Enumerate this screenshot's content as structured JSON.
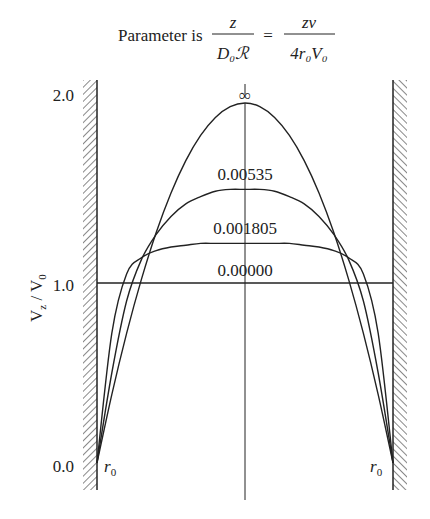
{
  "chart_data": {
    "type": "line",
    "title_parts": {
      "prefix": "Parameter is",
      "frac1_num": "z",
      "frac1_den": "D₀ℛ",
      "eq": "=",
      "frac2_num": "zv",
      "frac2_den": "4r₀V₀"
    },
    "xlabel": "",
    "ylabel": "Vz / V0",
    "ylabel_display": "V_z / V_0",
    "y_ticks": [
      "0.0",
      "1.0",
      "2.0"
    ],
    "ylim": [
      0,
      2.0
    ],
    "x_wall_labels": [
      "r₀",
      "r₀"
    ],
    "x": [
      -1.0,
      -0.9,
      -0.8,
      -0.7,
      -0.6,
      -0.5,
      -0.4,
      -0.3,
      -0.2,
      -0.1,
      0.0,
      0.1,
      0.2,
      0.3,
      0.4,
      0.5,
      0.6,
      0.7,
      0.8,
      0.9,
      1.0
    ],
    "series": [
      {
        "name": "∞",
        "values": [
          0.0,
          0.38,
          0.72,
          1.02,
          1.28,
          1.5,
          1.68,
          1.82,
          1.92,
          1.98,
          2.0,
          1.98,
          1.92,
          1.82,
          1.68,
          1.5,
          1.28,
          1.02,
          0.72,
          0.38,
          0.0
        ]
      },
      {
        "name": "0.00535",
        "values": [
          0.0,
          0.5,
          0.9,
          1.13,
          1.27,
          1.37,
          1.44,
          1.48,
          1.51,
          1.52,
          1.52,
          1.52,
          1.51,
          1.48,
          1.44,
          1.37,
          1.27,
          1.13,
          0.9,
          0.5,
          0.0
        ]
      },
      {
        "name": "0.001805",
        "values": [
          0.0,
          0.72,
          1.05,
          1.14,
          1.18,
          1.2,
          1.21,
          1.22,
          1.22,
          1.22,
          1.22,
          1.22,
          1.22,
          1.22,
          1.21,
          1.2,
          1.18,
          1.14,
          1.05,
          0.72,
          0.0
        ]
      },
      {
        "name": "0.00000",
        "values": [
          1.0,
          1.0,
          1.0,
          1.0,
          1.0,
          1.0,
          1.0,
          1.0,
          1.0,
          1.0,
          1.0,
          1.0,
          1.0,
          1.0,
          1.0,
          1.0,
          1.0,
          1.0,
          1.0,
          1.0,
          1.0
        ]
      }
    ],
    "annotations": [
      "∞",
      "0.00535",
      "0.001805",
      "0.00000"
    ],
    "grid": false,
    "legend": "inline labels above curve peaks"
  }
}
